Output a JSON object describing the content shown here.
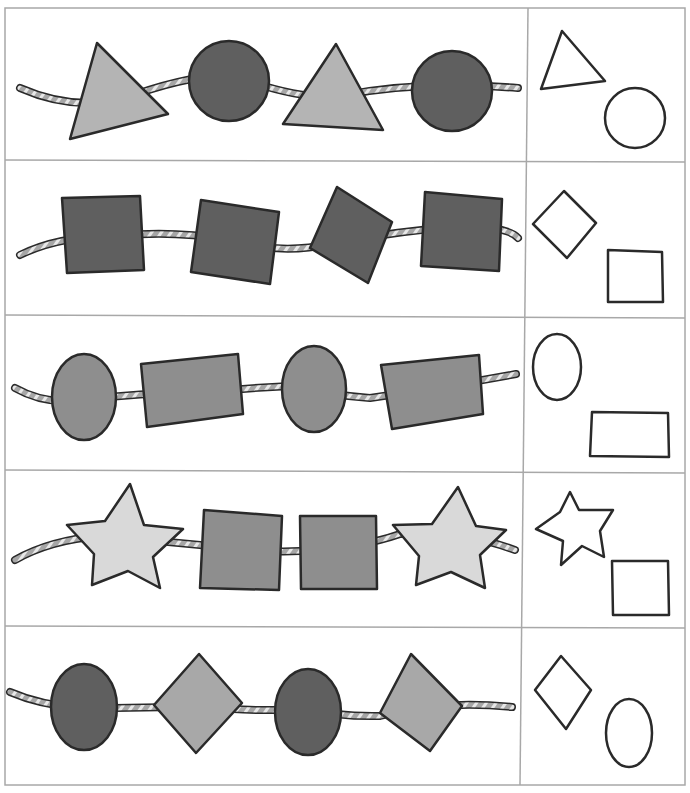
{
  "worksheet": {
    "title": "Pattern sequences - what comes next",
    "grid_color": "#a8a8a8",
    "outline_color": "#2a2a2a",
    "fills": {
      "dark": "#5f5f5f",
      "medium": "#8e8e8e",
      "light": "#b4b4b4",
      "pale": "#d9d9d9",
      "rope": "#9a9a9a"
    },
    "rows": [
      {
        "pattern": [
          "triangle",
          "circle",
          "triangle",
          "circle"
        ],
        "answer_options": [
          "triangle",
          "circle"
        ]
      },
      {
        "pattern": [
          "square",
          "square",
          "diamond",
          "square"
        ],
        "answer_options": [
          "diamond",
          "square"
        ]
      },
      {
        "pattern": [
          "oval",
          "rectangle",
          "oval",
          "rectangle"
        ],
        "answer_options": [
          "oval",
          "rectangle"
        ]
      },
      {
        "pattern": [
          "star",
          "square",
          "square",
          "star"
        ],
        "answer_options": [
          "star",
          "square"
        ]
      },
      {
        "pattern": [
          "oval",
          "diamond",
          "oval",
          "diamond"
        ],
        "answer_options": [
          "diamond",
          "oval"
        ]
      }
    ]
  }
}
